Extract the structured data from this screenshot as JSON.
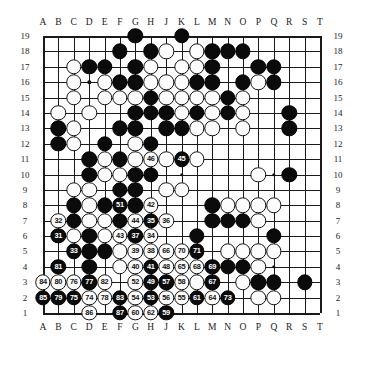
{
  "board": {
    "size": 19,
    "column_labels": [
      "A",
      "B",
      "C",
      "D",
      "E",
      "F",
      "G",
      "H",
      "J",
      "K",
      "L",
      "M",
      "N",
      "O",
      "P",
      "Q",
      "R",
      "S",
      "T"
    ],
    "row_labels": [
      "19",
      "18",
      "17",
      "16",
      "15",
      "14",
      "13",
      "12",
      "11",
      "10",
      "9",
      "8",
      "7",
      "6",
      "5",
      "4",
      "3",
      "2",
      "1"
    ],
    "colors": {
      "black": "#0b0b0b",
      "white": "#fdfdfd",
      "line": "#1a1a1a",
      "background": "#ffffff"
    },
    "hoshi_points": [
      [
        3,
        3
      ],
      [
        9,
        3
      ],
      [
        15,
        3
      ],
      [
        3,
        9
      ],
      [
        9,
        9
      ],
      [
        15,
        9
      ],
      [
        3,
        15
      ],
      [
        9,
        15
      ],
      [
        15,
        15
      ]
    ],
    "stones": [
      {
        "col": "G",
        "row": 19,
        "color": "black"
      },
      {
        "col": "K",
        "row": 19,
        "color": "black"
      },
      {
        "col": "F",
        "row": 18,
        "color": "black"
      },
      {
        "col": "H",
        "row": 18,
        "color": "black"
      },
      {
        "col": "J",
        "row": 18,
        "color": "white"
      },
      {
        "col": "L",
        "row": 18,
        "color": "white"
      },
      {
        "col": "M",
        "row": 18,
        "color": "black"
      },
      {
        "col": "N",
        "row": 18,
        "color": "black"
      },
      {
        "col": "O",
        "row": 18,
        "color": "black"
      },
      {
        "col": "C",
        "row": 17,
        "color": "white"
      },
      {
        "col": "D",
        "row": 17,
        "color": "black"
      },
      {
        "col": "E",
        "row": 17,
        "color": "black"
      },
      {
        "col": "G",
        "row": 17,
        "color": "black"
      },
      {
        "col": "H",
        "row": 17,
        "color": "white"
      },
      {
        "col": "K",
        "row": 17,
        "color": "white"
      },
      {
        "col": "L",
        "row": 17,
        "color": "white"
      },
      {
        "col": "M",
        "row": 17,
        "color": "black"
      },
      {
        "col": "P",
        "row": 17,
        "color": "black"
      },
      {
        "col": "Q",
        "row": 17,
        "color": "black"
      },
      {
        "col": "C",
        "row": 16,
        "color": "white"
      },
      {
        "col": "E",
        "row": 16,
        "color": "white"
      },
      {
        "col": "F",
        "row": 16,
        "color": "black"
      },
      {
        "col": "G",
        "row": 16,
        "color": "black"
      },
      {
        "col": "H",
        "row": 16,
        "color": "white"
      },
      {
        "col": "J",
        "row": 16,
        "color": "white"
      },
      {
        "col": "K",
        "row": 16,
        "color": "white"
      },
      {
        "col": "L",
        "row": 16,
        "color": "black"
      },
      {
        "col": "M",
        "row": 16,
        "color": "black"
      },
      {
        "col": "O",
        "row": 16,
        "color": "black"
      },
      {
        "col": "P",
        "row": 16,
        "color": "white"
      },
      {
        "col": "Q",
        "row": 16,
        "color": "black"
      },
      {
        "col": "C",
        "row": 15,
        "color": "white"
      },
      {
        "col": "E",
        "row": 15,
        "color": "white"
      },
      {
        "col": "F",
        "row": 15,
        "color": "white"
      },
      {
        "col": "G",
        "row": 15,
        "color": "white"
      },
      {
        "col": "H",
        "row": 15,
        "color": "black"
      },
      {
        "col": "J",
        "row": 15,
        "color": "white"
      },
      {
        "col": "K",
        "row": 15,
        "color": "white"
      },
      {
        "col": "L",
        "row": 15,
        "color": "white"
      },
      {
        "col": "M",
        "row": 15,
        "color": "white"
      },
      {
        "col": "N",
        "row": 15,
        "color": "black"
      },
      {
        "col": "O",
        "row": 15,
        "color": "white"
      },
      {
        "col": "B",
        "row": 14,
        "color": "white"
      },
      {
        "col": "D",
        "row": 14,
        "color": "white"
      },
      {
        "col": "G",
        "row": 14,
        "color": "black"
      },
      {
        "col": "H",
        "row": 14,
        "color": "black"
      },
      {
        "col": "J",
        "row": 14,
        "color": "black"
      },
      {
        "col": "K",
        "row": 14,
        "color": "white"
      },
      {
        "col": "L",
        "row": 14,
        "color": "black"
      },
      {
        "col": "M",
        "row": 14,
        "color": "white"
      },
      {
        "col": "N",
        "row": 14,
        "color": "black"
      },
      {
        "col": "O",
        "row": 14,
        "color": "white"
      },
      {
        "col": "R",
        "row": 14,
        "color": "black"
      },
      {
        "col": "B",
        "row": 13,
        "color": "black"
      },
      {
        "col": "C",
        "row": 13,
        "color": "white"
      },
      {
        "col": "F",
        "row": 13,
        "color": "black"
      },
      {
        "col": "G",
        "row": 13,
        "color": "black"
      },
      {
        "col": "J",
        "row": 13,
        "color": "black"
      },
      {
        "col": "K",
        "row": 13,
        "color": "black"
      },
      {
        "col": "L",
        "row": 13,
        "color": "white"
      },
      {
        "col": "M",
        "row": 13,
        "color": "white"
      },
      {
        "col": "O",
        "row": 13,
        "color": "white"
      },
      {
        "col": "R",
        "row": 13,
        "color": "black"
      },
      {
        "col": "B",
        "row": 12,
        "color": "black"
      },
      {
        "col": "C",
        "row": 12,
        "color": "white"
      },
      {
        "col": "E",
        "row": 12,
        "color": "black"
      },
      {
        "col": "G",
        "row": 12,
        "color": "white"
      },
      {
        "col": "H",
        "row": 12,
        "color": "black"
      },
      {
        "col": "D",
        "row": 11,
        "color": "black"
      },
      {
        "col": "E",
        "row": 11,
        "color": "white"
      },
      {
        "col": "F",
        "row": 11,
        "color": "black"
      },
      {
        "col": "G",
        "row": 11,
        "color": "white"
      },
      {
        "col": "H",
        "row": 11,
        "color": "white",
        "label": "46"
      },
      {
        "col": "J",
        "row": 11,
        "color": "white"
      },
      {
        "col": "K",
        "row": 11,
        "color": "black",
        "label": "45"
      },
      {
        "col": "L",
        "row": 11,
        "color": "white"
      },
      {
        "col": "D",
        "row": 10,
        "color": "black"
      },
      {
        "col": "E",
        "row": 10,
        "color": "white"
      },
      {
        "col": "F",
        "row": 10,
        "color": "white"
      },
      {
        "col": "G",
        "row": 10,
        "color": "black"
      },
      {
        "col": "H",
        "row": 10,
        "color": "black"
      },
      {
        "col": "P",
        "row": 10,
        "color": "white"
      },
      {
        "col": "R",
        "row": 10,
        "color": "black"
      },
      {
        "col": "C",
        "row": 9,
        "color": "white"
      },
      {
        "col": "D",
        "row": 9,
        "color": "white"
      },
      {
        "col": "F",
        "row": 9,
        "color": "black"
      },
      {
        "col": "G",
        "row": 9,
        "color": "black"
      },
      {
        "col": "J",
        "row": 9,
        "color": "white"
      },
      {
        "col": "K",
        "row": 9,
        "color": "white"
      },
      {
        "col": "C",
        "row": 8,
        "color": "black"
      },
      {
        "col": "D",
        "row": 8,
        "color": "white"
      },
      {
        "col": "E",
        "row": 8,
        "color": "black"
      },
      {
        "col": "F",
        "row": 8,
        "color": "black",
        "label": "51"
      },
      {
        "col": "G",
        "row": 8,
        "color": "black"
      },
      {
        "col": "H",
        "row": 8,
        "color": "white",
        "label": "42"
      },
      {
        "col": "M",
        "row": 8,
        "color": "black"
      },
      {
        "col": "N",
        "row": 8,
        "color": "white"
      },
      {
        "col": "O",
        "row": 8,
        "color": "white"
      },
      {
        "col": "P",
        "row": 8,
        "color": "white"
      },
      {
        "col": "Q",
        "row": 8,
        "color": "white"
      },
      {
        "col": "B",
        "row": 7,
        "color": "white",
        "label": "32"
      },
      {
        "col": "C",
        "row": 7,
        "color": "black"
      },
      {
        "col": "D",
        "row": 7,
        "color": "white"
      },
      {
        "col": "E",
        "row": 7,
        "color": "white"
      },
      {
        "col": "F",
        "row": 7,
        "color": "black"
      },
      {
        "col": "G",
        "row": 7,
        "color": "white",
        "label": "44"
      },
      {
        "col": "H",
        "row": 7,
        "color": "black",
        "label": "35"
      },
      {
        "col": "J",
        "row": 7,
        "color": "white",
        "label": "36"
      },
      {
        "col": "M",
        "row": 7,
        "color": "black"
      },
      {
        "col": "N",
        "row": 7,
        "color": "black"
      },
      {
        "col": "O",
        "row": 7,
        "color": "black"
      },
      {
        "col": "P",
        "row": 7,
        "color": "white"
      },
      {
        "col": "B",
        "row": 6,
        "color": "black",
        "label": "31"
      },
      {
        "col": "C",
        "row": 6,
        "color": "white"
      },
      {
        "col": "D",
        "row": 6,
        "color": "black"
      },
      {
        "col": "E",
        "row": 6,
        "color": "white"
      },
      {
        "col": "F",
        "row": 6,
        "color": "white",
        "label": "43"
      },
      {
        "col": "G",
        "row": 6,
        "color": "black",
        "label": "37"
      },
      {
        "col": "H",
        "row": 6,
        "color": "white",
        "label": "34"
      },
      {
        "col": "L",
        "row": 6,
        "color": "black"
      },
      {
        "col": "Q",
        "row": 6,
        "color": "black"
      },
      {
        "col": "C",
        "row": 5,
        "color": "black",
        "label": "33"
      },
      {
        "col": "D",
        "row": 5,
        "color": "black"
      },
      {
        "col": "E",
        "row": 5,
        "color": "black"
      },
      {
        "col": "F",
        "row": 5,
        "color": "white"
      },
      {
        "col": "G",
        "row": 5,
        "color": "white",
        "label": "39"
      },
      {
        "col": "H",
        "row": 5,
        "color": "white",
        "label": "38"
      },
      {
        "col": "J",
        "row": 5,
        "color": "white",
        "label": "66"
      },
      {
        "col": "K",
        "row": 5,
        "color": "white",
        "label": "70"
      },
      {
        "col": "L",
        "row": 5,
        "color": "black",
        "label": "71"
      },
      {
        "col": "N",
        "row": 5,
        "color": "white"
      },
      {
        "col": "O",
        "row": 5,
        "color": "white"
      },
      {
        "col": "P",
        "row": 5,
        "color": "white"
      },
      {
        "col": "Q",
        "row": 5,
        "color": "white"
      },
      {
        "col": "B",
        "row": 4,
        "color": "black",
        "label": "81"
      },
      {
        "col": "D",
        "row": 4,
        "color": "black"
      },
      {
        "col": "F",
        "row": 4,
        "color": "white"
      },
      {
        "col": "G",
        "row": 4,
        "color": "white",
        "label": "40"
      },
      {
        "col": "H",
        "row": 4,
        "color": "black",
        "label": "41"
      },
      {
        "col": "J",
        "row": 4,
        "color": "white",
        "label": "48"
      },
      {
        "col": "K",
        "row": 4,
        "color": "white",
        "label": "65"
      },
      {
        "col": "L",
        "row": 4,
        "color": "white",
        "label": "68"
      },
      {
        "col": "M",
        "row": 4,
        "color": "black",
        "label": "69"
      },
      {
        "col": "N",
        "row": 4,
        "color": "black"
      },
      {
        "col": "O",
        "row": 4,
        "color": "black"
      },
      {
        "col": "P",
        "row": 4,
        "color": "white"
      },
      {
        "col": "A",
        "row": 3,
        "color": "white",
        "label": "84"
      },
      {
        "col": "B",
        "row": 3,
        "color": "white",
        "label": "80"
      },
      {
        "col": "C",
        "row": 3,
        "color": "white",
        "label": "76"
      },
      {
        "col": "D",
        "row": 3,
        "color": "black",
        "label": "77"
      },
      {
        "col": "E",
        "row": 3,
        "color": "white",
        "label": "82"
      },
      {
        "col": "G",
        "row": 3,
        "color": "white",
        "label": "52"
      },
      {
        "col": "H",
        "row": 3,
        "color": "black",
        "label": "49"
      },
      {
        "col": "J",
        "row": 3,
        "color": "black",
        "label": "57"
      },
      {
        "col": "K",
        "row": 3,
        "color": "white",
        "label": "58"
      },
      {
        "col": "L",
        "row": 3,
        "color": "white"
      },
      {
        "col": "M",
        "row": 3,
        "color": "black",
        "label": "67"
      },
      {
        "col": "O",
        "row": 3,
        "color": "white"
      },
      {
        "col": "P",
        "row": 3,
        "color": "black"
      },
      {
        "col": "Q",
        "row": 3,
        "color": "black"
      },
      {
        "col": "S",
        "row": 3,
        "color": "black"
      },
      {
        "col": "A",
        "row": 2,
        "color": "black",
        "label": "85"
      },
      {
        "col": "B",
        "row": 2,
        "color": "black",
        "label": "79"
      },
      {
        "col": "C",
        "row": 2,
        "color": "black",
        "label": "75"
      },
      {
        "col": "D",
        "row": 2,
        "color": "white",
        "label": "74"
      },
      {
        "col": "E",
        "row": 2,
        "color": "white",
        "label": "78"
      },
      {
        "col": "F",
        "row": 2,
        "color": "black",
        "label": "83"
      },
      {
        "col": "G",
        "row": 2,
        "color": "white",
        "label": "54"
      },
      {
        "col": "H",
        "row": 2,
        "color": "black",
        "label": "53"
      },
      {
        "col": "J",
        "row": 2,
        "color": "white",
        "label": "56"
      },
      {
        "col": "K",
        "row": 2,
        "color": "white",
        "label": "55"
      },
      {
        "col": "L",
        "row": 2,
        "color": "black",
        "label": "61"
      },
      {
        "col": "M",
        "row": 2,
        "color": "white",
        "label": "64"
      },
      {
        "col": "N",
        "row": 2,
        "color": "black",
        "label": "73"
      },
      {
        "col": "P",
        "row": 2,
        "color": "white"
      },
      {
        "col": "Q",
        "row": 2,
        "color": "white"
      },
      {
        "col": "D",
        "row": 1,
        "color": "white",
        "label": "86"
      },
      {
        "col": "F",
        "row": 1,
        "color": "black",
        "label": "87"
      },
      {
        "col": "G",
        "row": 1,
        "color": "white",
        "label": "60"
      },
      {
        "col": "H",
        "row": 1,
        "color": "white",
        "label": "62"
      },
      {
        "col": "J",
        "row": 1,
        "color": "black",
        "label": "59"
      }
    ]
  }
}
